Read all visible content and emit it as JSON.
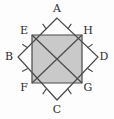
{
  "figure": {
    "background_color": "#fdfdfd",
    "stroke_color": "#4a4a4a",
    "fill_color": "#c9c9c9",
    "label_color": "#2b2b2b",
    "outer_quadrilateral": {
      "name": "ABCD",
      "vertices": [
        {
          "id": "A",
          "label": "A",
          "x": 57,
          "y": 18,
          "label_x": 57,
          "label_y": 9
        },
        {
          "id": "B",
          "label": "B",
          "x": 18,
          "y": 57,
          "label_x": 9,
          "label_y": 57
        },
        {
          "id": "C",
          "label": "C",
          "x": 57,
          "y": 100,
          "label_x": 57,
          "label_y": 110
        },
        {
          "id": "D",
          "label": "D",
          "x": 98,
          "y": 57,
          "label_x": 104,
          "label_y": 57
        }
      ]
    },
    "inner_square": {
      "name": "EHGF",
      "filled": true,
      "vertices": [
        {
          "id": "E",
          "label": "E",
          "x": 32,
          "y": 35,
          "label_x": 24,
          "label_y": 31
        },
        {
          "id": "H",
          "label": "H",
          "x": 82,
          "y": 35,
          "label_x": 88,
          "label_y": 31
        },
        {
          "id": "G",
          "label": "G",
          "x": 82,
          "y": 83,
          "label_x": 88,
          "label_y": 88
        },
        {
          "id": "F",
          "label": "F",
          "x": 32,
          "y": 83,
          "label_x": 24,
          "label_y": 88
        }
      ]
    },
    "diagonals": [
      {
        "id": "EG",
        "from": "E",
        "to": "G"
      },
      {
        "id": "HF",
        "from": "H",
        "to": "F"
      }
    ],
    "tick_marks": {
      "count_per_segment": 1,
      "segments": [
        {
          "id": "AE",
          "from": "A",
          "to": "E"
        },
        {
          "id": "AH",
          "from": "A",
          "to": "H"
        },
        {
          "id": "BE",
          "from": "B",
          "to": "E"
        },
        {
          "id": "BF",
          "from": "B",
          "to": "F"
        },
        {
          "id": "CF",
          "from": "C",
          "to": "F"
        },
        {
          "id": "CG",
          "from": "C",
          "to": "G"
        },
        {
          "id": "DH",
          "from": "D",
          "to": "H"
        },
        {
          "id": "DG",
          "from": "D",
          "to": "G"
        }
      ]
    }
  }
}
